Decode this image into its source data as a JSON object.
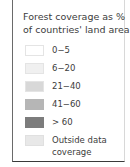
{
  "legend": {
    "title_line1": "Forest coverage as %",
    "title_line2": "of countries' land area",
    "items": [
      {
        "label": "0−5",
        "color": "#ffffff"
      },
      {
        "label": "6−20",
        "color": "#f0f0f0"
      },
      {
        "label": "21−40",
        "color": "#d6d6d6"
      },
      {
        "label": "41−60",
        "color": "#b4b4b4"
      },
      {
        "label": "> 60",
        "color": "#7a7a7a"
      },
      {
        "label": "Outside data",
        "label2": "coverage",
        "color": "#e6e6e6"
      }
    ]
  }
}
